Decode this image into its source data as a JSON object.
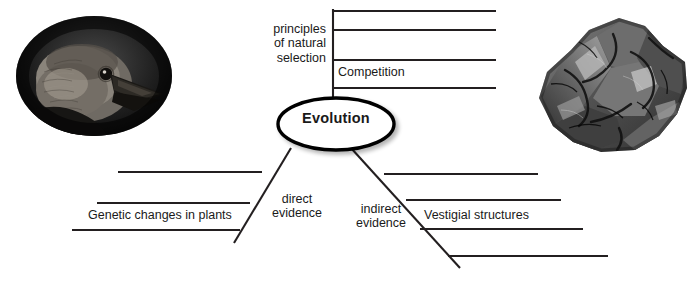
{
  "diagram": {
    "type": "concept-map",
    "title_node": "Evolution",
    "background_color": "#ffffff",
    "line_color": "#231f20",
    "text_color": "#1a1a1a",
    "branches": [
      {
        "name": "principles-of-natural-selection",
        "label": "principles\nof natural\nselection",
        "orientation": "top",
        "write_on_lines": 4,
        "filled_entries": [
          "Competition"
        ]
      },
      {
        "name": "direct-evidence",
        "label": "direct\nevidence",
        "orientation": "bottom-left",
        "write_on_lines": 3,
        "filled_entries": [
          "Genetic changes in plants"
        ]
      },
      {
        "name": "indirect-evidence",
        "label": "indirect\nevidence",
        "orientation": "bottom-right",
        "write_on_lines": 4,
        "filled_entries": [
          "Vestigial structures"
        ]
      }
    ]
  },
  "labels": {
    "principles": "principles\nof natural\nselection",
    "competition": "Competition",
    "evolution": "Evolution",
    "direct_evidence": "direct\nevidence",
    "indirect_evidence": "indirect\nevidence",
    "genetic_changes": "Genetic changes in plants",
    "vestigial_structures": "Vestigial structures",
    "caption": ""
  },
  "images": {
    "finch": {
      "name": "finch-head-photo",
      "description": "black and white oval photograph of a finch head in profile",
      "shape": "oval",
      "style": "grayscale"
    },
    "fossil": {
      "name": "fossil-rock-photo",
      "description": "grayscale photograph of a fossil bearing rock specimen",
      "shape": "irregular",
      "style": "grayscale"
    }
  },
  "colors": {
    "ink": "#231f20",
    "paper": "#ffffff",
    "shadow": "#d9d9d9"
  }
}
